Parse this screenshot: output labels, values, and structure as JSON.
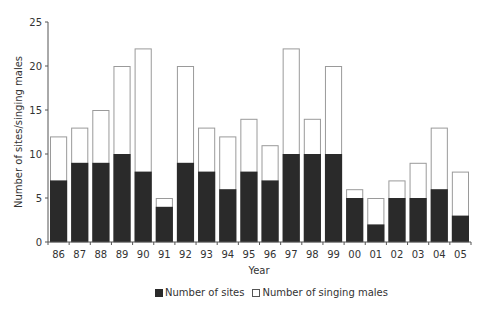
{
  "chart_data": {
    "type": "bar",
    "stacking": "overlay",
    "title": "",
    "xlabel": "Year",
    "ylabel": "Number of sites/singing males",
    "ylim": [
      0,
      25
    ],
    "yticks": [
      0,
      5,
      10,
      15,
      20,
      25
    ],
    "grid": false,
    "legend_position": "bottom",
    "categories": [
      "86",
      "87",
      "88",
      "89",
      "90",
      "91",
      "92",
      "93",
      "94",
      "95",
      "96",
      "97",
      "98",
      "99",
      "00",
      "01",
      "02",
      "03",
      "04",
      "05"
    ],
    "series": [
      {
        "name": "Number of sites",
        "color": "#2a2a2a",
        "values": [
          7,
          9,
          9,
          10,
          8,
          4,
          9,
          8,
          6,
          8,
          7,
          10,
          10,
          10,
          5,
          2,
          5,
          5,
          6,
          3
        ]
      },
      {
        "name": "Number of singing males",
        "color": "#ffffff",
        "values": [
          12,
          13,
          15,
          20,
          22,
          5,
          20,
          13,
          12,
          14,
          11,
          22,
          14,
          20,
          6,
          5,
          7,
          9,
          13,
          8
        ]
      }
    ]
  },
  "legend": {
    "sites_label": "Number of sites",
    "males_label": "Number of singing males"
  },
  "axes": {
    "x_title": "Year",
    "y_title": "Number of sites/singing males"
  }
}
